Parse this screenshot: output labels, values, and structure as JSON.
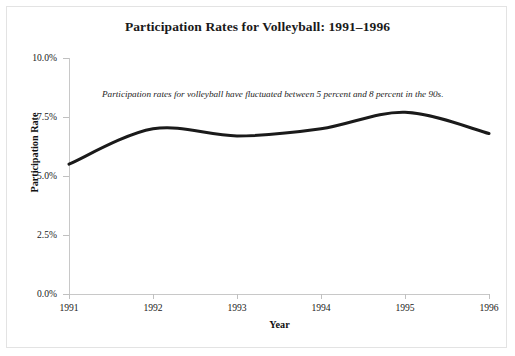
{
  "chart_data": {
    "type": "line",
    "title": "Participation Rates for Volleyball: 1991–1996",
    "xlabel": "Year",
    "ylabel": "Participation Rate",
    "x": [
      1991,
      1992,
      1993,
      1994,
      1995,
      1996
    ],
    "categories": [
      "1991",
      "1992",
      "1993",
      "1994",
      "1995",
      "1996"
    ],
    "values": [
      5.5,
      7.0,
      6.7,
      7.0,
      7.7,
      6.8
    ],
    "series": [
      {
        "name": "Participation Rate",
        "values": [
          5.5,
          7.0,
          6.7,
          7.0,
          7.7,
          6.8
        ]
      }
    ],
    "xlim": [
      1991,
      1996
    ],
    "ylim": [
      0.0,
      10.0
    ],
    "ytick_values": [
      0.0,
      2.5,
      5.0,
      7.5,
      10.0
    ],
    "ytick_labels": [
      "0.0%",
      "2.5%",
      "5.0%",
      "7.5%",
      "10.0%"
    ],
    "xtick_labels": [
      "1991",
      "1992",
      "1993",
      "1994",
      "1995",
      "1996"
    ],
    "grid": false,
    "legend": "none",
    "smoothing": "spline",
    "annotations": [
      "Participation rates for volleyball have fluctuated between 5 percent and 8 percent in the 90s."
    ],
    "line_color": "#1a1a1a",
    "line_width": 3,
    "axis_color": "#c8c8c8",
    "background_color": "#ffffff",
    "border_color": "#e3e3e3"
  },
  "annotation": {
    "text": "Participation rates for volleyball have fluctuated between 5 percent and 8 percent in the 90s."
  }
}
